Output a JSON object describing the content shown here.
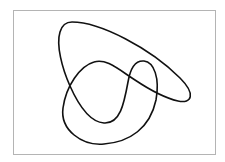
{
  "diagram": {
    "type": "closed-curve",
    "frame_color": "#b4b4b4",
    "curve_color": "#111111",
    "background_color": "#ffffff",
    "crossings": 3
  }
}
